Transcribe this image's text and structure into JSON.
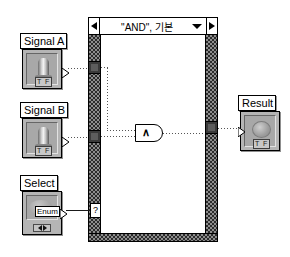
{
  "diagram": {
    "type": "labview-block-diagram"
  },
  "case_structure": {
    "selector_label": "\"AND\", 기본",
    "prev_case_icon": "triangle-left-icon",
    "next_case_icon": "triangle-right-icon",
    "dropdown_icon": "chevron-down-icon",
    "selector_terminal_glyph": "?",
    "selector_terminal_name": "case-selector-terminal"
  },
  "controls": [
    {
      "id": "signal-a",
      "label": "Signal A",
      "datatype": "boolean",
      "tf_tag": "T F",
      "glyph": "vertical-toggle-switch-icon"
    },
    {
      "id": "signal-b",
      "label": "Signal B",
      "datatype": "boolean",
      "tf_tag": "T F",
      "glyph": "vertical-toggle-switch-icon"
    },
    {
      "id": "select",
      "label": "Select",
      "datatype": "enum",
      "badge": "Enum",
      "glyph": "enum-ring-icon",
      "increment_icon": "left-right-arrows-icon"
    }
  ],
  "indicators": [
    {
      "id": "result",
      "label": "Result",
      "datatype": "boolean",
      "tf_tag": "T F",
      "glyph": "round-led-icon"
    }
  ],
  "functions": [
    {
      "id": "and-gate",
      "name": "And",
      "glyph": "∧",
      "inputs": 2,
      "outputs": 1
    }
  ],
  "tunnels": [
    {
      "id": "tunnel-signal-a",
      "side": "left"
    },
    {
      "id": "tunnel-signal-b",
      "side": "left"
    },
    {
      "id": "tunnel-result",
      "side": "right"
    }
  ],
  "colors": {
    "background": "#ffffff",
    "terminal_face": "#b5b5b5",
    "terminal_inner": "#a8a8a8",
    "structure_border": "#2b2b2b",
    "tunnel_fill": "#3a3a3a",
    "wire": "#555555",
    "outline": "#000000"
  }
}
